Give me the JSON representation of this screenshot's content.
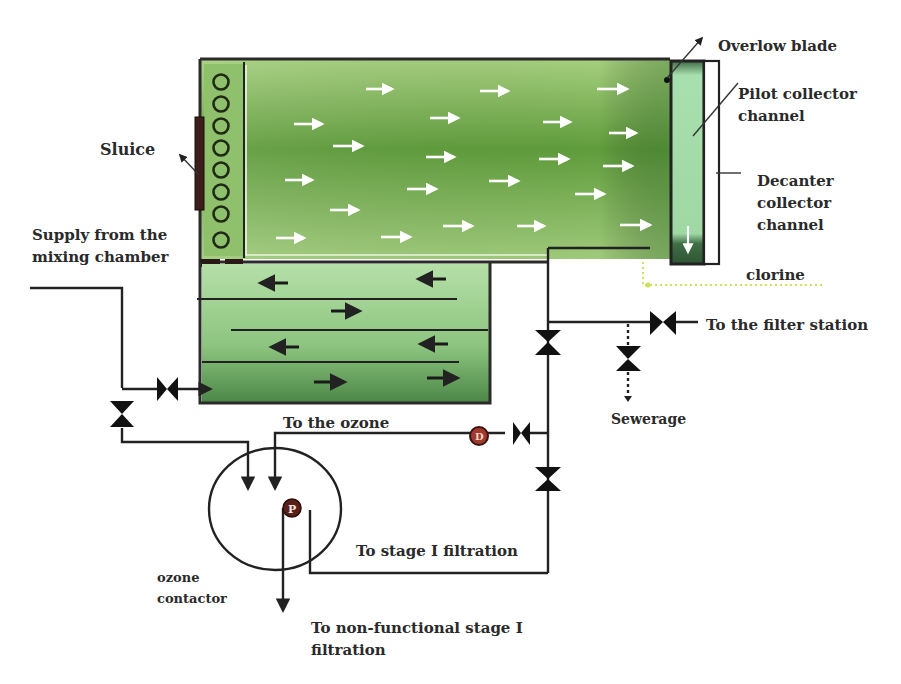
{
  "colors": {
    "tank_dark": "#5e9a3a",
    "tank_mid": "#82b65a",
    "tank_light": "#a9d28a",
    "lower_light": "#a8d89a",
    "lower_dark": "#4f8a4a",
    "channel": "#9fd8a0",
    "channel_dark": "#3f6e45",
    "pipe": "#222222",
    "chlorine_line": "#d8e86a",
    "meter": "#8a2a22"
  },
  "labels": {
    "sluice": "Sluice",
    "supply_1": "Supply from the",
    "supply_2": "mixing chamber",
    "overflow_blade": "Overlow blade",
    "pilot_1": "Pilot collector",
    "pilot_2": "channel",
    "decanter_1": "Decanter",
    "decanter_2": "collector",
    "decanter_3": "channel",
    "chlorine": "clorine",
    "filter_station": "To the filter station",
    "sewerage": "Sewerage",
    "to_ozone": "To the ozone",
    "stage1": "To stage I filtration",
    "ozone_1": "ozone",
    "ozone_2": "contactor",
    "nonfunc_1": "To non-functional stage I",
    "nonfunc_2": "filtration",
    "pump_symbol": "P",
    "meter_symbol": "D"
  },
  "components": {
    "settling_tank": "upper settling basin with flow arrows (right-directed)",
    "baffle_tank": "lower 4-pass baffled flocculation tank",
    "sluice_orifices": 8,
    "valves": 7
  }
}
